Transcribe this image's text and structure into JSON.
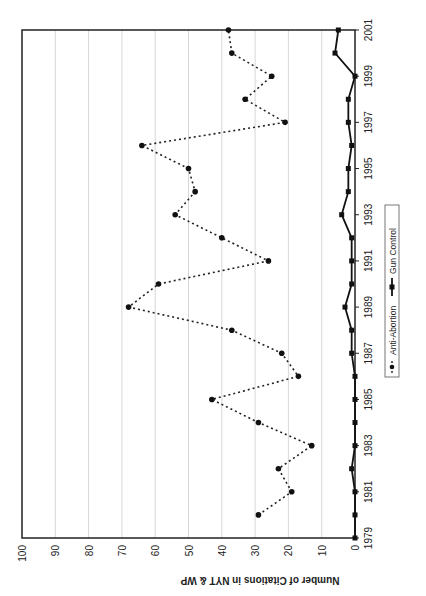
{
  "chart_data": {
    "type": "line",
    "title": "",
    "xlabel": "",
    "ylabel": "Number of Citations in NYT & WP",
    "ylim": [
      0,
      100
    ],
    "yticks": [
      0,
      10,
      20,
      30,
      40,
      50,
      60,
      70,
      80,
      90,
      100
    ],
    "xticks": [
      "1979",
      "1981",
      "1983",
      "1985",
      "1987",
      "1989",
      "1991",
      "1993",
      "1995",
      "1997",
      "1999",
      "2001"
    ],
    "x": [
      1979,
      1980,
      1981,
      1982,
      1983,
      1984,
      1985,
      1986,
      1987,
      1988,
      1989,
      1990,
      1991,
      1992,
      1993,
      1994,
      1995,
      1996,
      1997,
      1998,
      1999,
      2000,
      2001
    ],
    "grid": true,
    "orientation": "rotated 90 degrees clockwise",
    "legend_position": "bottom",
    "series": [
      {
        "name": "Anti-Abortion",
        "style": "dotted-circle",
        "values": [
          null,
          29,
          19,
          23,
          13,
          29,
          43,
          17,
          22,
          37,
          68,
          59,
          26,
          40,
          54,
          48,
          50,
          64,
          21,
          33,
          25,
          37,
          38
        ]
      },
      {
        "name": "Gun Control",
        "style": "solid-square",
        "values": [
          0,
          0,
          0,
          1,
          0,
          0,
          0,
          0,
          1,
          1,
          3,
          1,
          1,
          1,
          4,
          2,
          2,
          1,
          2,
          2,
          0,
          6,
          5
        ]
      }
    ]
  }
}
